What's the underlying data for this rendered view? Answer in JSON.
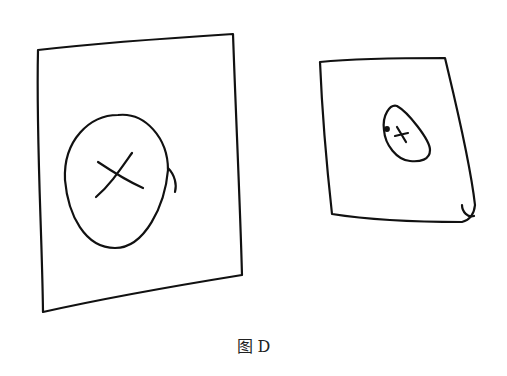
{
  "caption": "图 D",
  "figures": [
    {
      "name": "large-card",
      "shape": "skewed rectangle",
      "mark": "circle with x",
      "stroke": "#111111"
    },
    {
      "name": "small-card",
      "shape": "skewed rectangle",
      "mark": "small oval with x",
      "stroke": "#111111"
    }
  ]
}
